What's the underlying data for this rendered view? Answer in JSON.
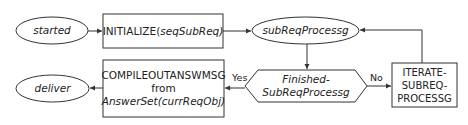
{
  "nodes": {
    "started": {
      "label": "started",
      "shape": "ellipse"
    },
    "initialize": {
      "label_main": "INITIALIZE(",
      "label_arg": "seqSubReq)",
      "shape": "rectangle"
    },
    "subreq": {
      "label": "subReqProcessg",
      "shape": "ellipse"
    },
    "finished": {
      "line1": "Finished-",
      "line2": "SubReqProcessg",
      "shape": "hexagon"
    },
    "iterate": {
      "line1": "ITERATE-",
      "line2": "SUBREQ-",
      "line3": "PROCESSG",
      "shape": "rectangle"
    },
    "compile": {
      "line1": "COMPILEOUTANSWMSG",
      "line2": "from",
      "line3": "AnswerSet(currReqObj)",
      "shape": "rectangle"
    },
    "deliver": {
      "label": "deliver",
      "shape": "ellipse"
    }
  },
  "edges": {
    "yes": "Yes",
    "no": "No"
  },
  "colors": {
    "stroke": "#333333",
    "background": "#ffffff"
  }
}
